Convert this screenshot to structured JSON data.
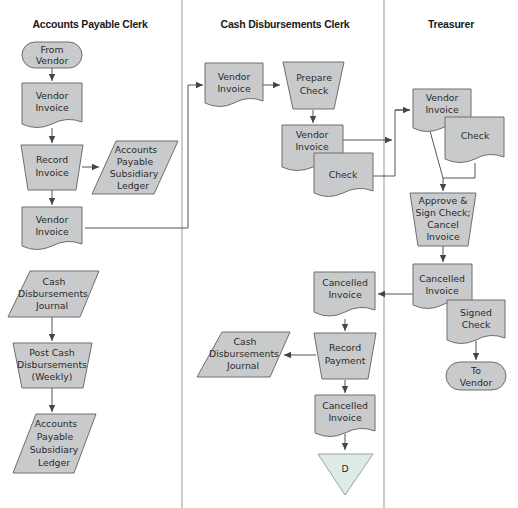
{
  "diagram": {
    "type": "swimlane-flowchart",
    "colors": {
      "shape_fill": "#c9cacc",
      "shape_stroke": "#6e6e70",
      "offpage_fill": "#dfece6",
      "divider": "#a9a9ab"
    },
    "lanes": [
      {
        "id": "ap",
        "title": "Accounts Payable Clerk"
      },
      {
        "id": "cd",
        "title": "Cash Disbursements Clerk"
      },
      {
        "id": "tr",
        "title": "Treasurer"
      }
    ],
    "nodes": {
      "ap_from_vendor": {
        "shape": "terminal",
        "lines": [
          "From",
          "Vendor"
        ]
      },
      "ap_vendor_invoice_1": {
        "shape": "document",
        "lines": [
          "Vendor",
          "Invoice"
        ]
      },
      "ap_record_invoice": {
        "shape": "manual-operation",
        "lines": [
          "Record",
          "Invoice"
        ]
      },
      "ap_ledger_1": {
        "shape": "data",
        "lines": [
          "Accounts",
          "Payable",
          "Subsidiary",
          "Ledger"
        ]
      },
      "ap_vendor_invoice_2": {
        "shape": "document",
        "lines": [
          "Vendor",
          "Invoice"
        ]
      },
      "ap_cash_journal": {
        "shape": "data",
        "lines": [
          "Cash",
          "Disbursements",
          "Journal"
        ]
      },
      "ap_post_cash": {
        "shape": "manual-operation",
        "lines": [
          "Post Cash",
          "Disbursements",
          "(Weekly)"
        ]
      },
      "ap_ledger_2": {
        "shape": "data",
        "lines": [
          "Accounts",
          "Payable",
          "Subsidiary",
          "Ledger"
        ]
      },
      "cd_vendor_invoice_1": {
        "shape": "document",
        "lines": [
          "Vendor",
          "Invoice"
        ]
      },
      "cd_prepare_check": {
        "shape": "manual-operation",
        "lines": [
          "Prepare",
          "Check"
        ]
      },
      "cd_vendor_invoice_2": {
        "shape": "document",
        "lines": [
          "Vendor",
          "Invoice"
        ]
      },
      "cd_check": {
        "shape": "document",
        "lines": [
          "Check"
        ]
      },
      "cd_cancelled_invoice_1": {
        "shape": "document",
        "lines": [
          "Cancelled",
          "Invoice"
        ]
      },
      "cd_record_payment": {
        "shape": "manual-operation",
        "lines": [
          "Record",
          "Payment"
        ]
      },
      "cd_cash_journal": {
        "shape": "data",
        "lines": [
          "Cash",
          "Disbursements",
          "Journal"
        ]
      },
      "cd_cancelled_invoice_2": {
        "shape": "document",
        "lines": [
          "Cancelled",
          "Invoice"
        ]
      },
      "cd_offpage_d": {
        "shape": "off-page-connector",
        "lines": [
          "D"
        ]
      },
      "tr_vendor_invoice": {
        "shape": "document",
        "lines": [
          "Vendor",
          "Invoice"
        ]
      },
      "tr_check": {
        "shape": "document",
        "lines": [
          "Check"
        ]
      },
      "tr_approve": {
        "shape": "manual-operation",
        "lines": [
          "Approve &",
          "Sign Check;",
          "Cancel",
          "Invoice"
        ]
      },
      "tr_cancelled_invoice": {
        "shape": "document",
        "lines": [
          "Cancelled",
          "Invoice"
        ]
      },
      "tr_signed_check": {
        "shape": "document",
        "lines": [
          "Signed",
          "Check"
        ]
      },
      "tr_to_vendor": {
        "shape": "terminal",
        "lines": [
          "To",
          "Vendor"
        ]
      }
    },
    "edges": [
      [
        "ap_from_vendor",
        "ap_vendor_invoice_1"
      ],
      [
        "ap_vendor_invoice_1",
        "ap_record_invoice"
      ],
      [
        "ap_record_invoice",
        "ap_ledger_1"
      ],
      [
        "ap_record_invoice",
        "ap_vendor_invoice_2"
      ],
      [
        "ap_vendor_invoice_2",
        "cd_vendor_invoice_1"
      ],
      [
        "cd_vendor_invoice_1",
        "cd_prepare_check"
      ],
      [
        "cd_prepare_check",
        "cd_vendor_invoice_2"
      ],
      [
        "cd_vendor_invoice_2",
        "tr_vendor_invoice"
      ],
      [
        "cd_check",
        "tr_vendor_invoice"
      ],
      [
        "tr_vendor_invoice",
        "tr_approve"
      ],
      [
        "tr_check",
        "tr_approve"
      ],
      [
        "tr_approve",
        "tr_cancelled_invoice"
      ],
      [
        "tr_cancelled_invoice",
        "cd_cancelled_invoice_1"
      ],
      [
        "tr_signed_check",
        "tr_to_vendor"
      ],
      [
        "cd_cancelled_invoice_1",
        "cd_record_payment"
      ],
      [
        "cd_record_payment",
        "cd_cash_journal"
      ],
      [
        "cd_record_payment",
        "cd_cancelled_invoice_2"
      ],
      [
        "cd_cancelled_invoice_2",
        "cd_offpage_d"
      ],
      [
        "ap_cash_journal",
        "ap_post_cash"
      ],
      [
        "ap_post_cash",
        "ap_ledger_2"
      ]
    ]
  }
}
